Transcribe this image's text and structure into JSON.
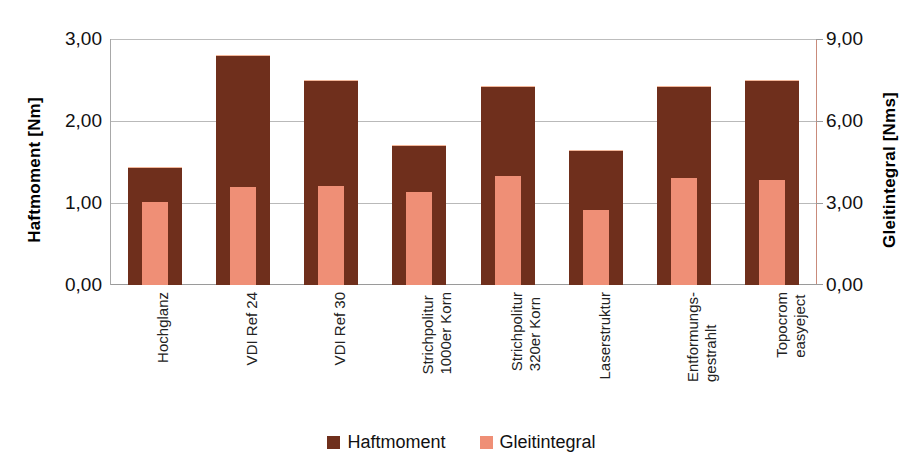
{
  "chart_data": {
    "type": "bar",
    "title": "",
    "subtitle": "",
    "grid": true,
    "legend_position": "bottom",
    "categories": [
      "Hochglanz",
      "VDI Ref 24",
      "VDI Ref 30",
      "Strichpolitur 1000er Korn",
      "Strichpolitur 320er Korn",
      "Laserstruktur",
      "Entformungs- gestrahlt",
      "Topocrom easyeject"
    ],
    "category_lines": [
      [
        "Hochglanz",
        ""
      ],
      [
        "VDI Ref 24",
        ""
      ],
      [
        "VDI Ref 30",
        ""
      ],
      [
        "Strichpolitur",
        "1000er Korn"
      ],
      [
        "Strichpolitur",
        "320er Korn"
      ],
      [
        "Laserstruktur",
        ""
      ],
      [
        "Entformungs-",
        "gestrahlt"
      ],
      [
        "Topocrom",
        "easyeject"
      ]
    ],
    "series": [
      {
        "name": "Haftmoment",
        "axis": "left",
        "unit": "Nm",
        "color": "#6f2f1c",
        "values": [
          1.43,
          2.79,
          2.49,
          1.69,
          2.41,
          1.63,
          2.41,
          2.49
        ]
      },
      {
        "name": "Gleitintegral",
        "axis": "right",
        "unit": "Nms",
        "color": "#ef8f76",
        "values": [
          3.03,
          3.57,
          3.63,
          3.39,
          3.99,
          2.73,
          3.93,
          3.84
        ]
      }
    ],
    "xlabel": "",
    "ylabel_left": "Haftmoment   [Nm]",
    "ylabel_right": "Gleitintegral   [Nms]",
    "ylim_left": [
      0,
      3
    ],
    "ylim_right": [
      0,
      9
    ],
    "yticks_left": [
      "0,00",
      "1,00",
      "2,00",
      "3,00"
    ],
    "yticks_right": [
      "0,00",
      "3,00",
      "6,00",
      "9,00"
    ],
    "ytick_values_left": [
      0,
      1,
      2,
      3
    ],
    "ytick_values_right": [
      0,
      3,
      6,
      9
    ]
  },
  "axes": {
    "left": {
      "title": "Haftmoment   [Nm]",
      "ticks": [
        "3,00",
        "2,00",
        "1,00",
        "0,00"
      ]
    },
    "right": {
      "title": "Gleitintegral   [Nms]",
      "ticks": [
        "9,00",
        "6,00",
        "3,00",
        "0,00"
      ]
    }
  },
  "legend": {
    "items": [
      {
        "label": "Haftmoment",
        "color": "#6f2f1c",
        "swatch": "square-swatch"
      },
      {
        "label": "Gleitintegral",
        "color": "#ef8f76",
        "swatch": "square-swatch"
      }
    ]
  },
  "colors": {
    "haftmoment": "#6f2f1c",
    "gleitintegral": "#ef8f76",
    "grid": "#b9b9b9",
    "axis": "#9a9a9a",
    "background": "#ffffff"
  }
}
